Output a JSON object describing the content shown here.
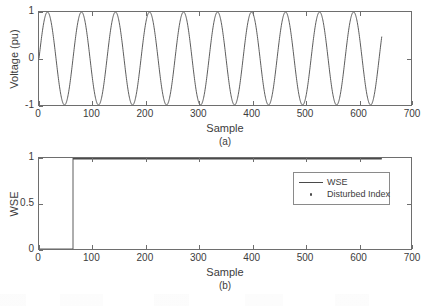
{
  "figure": {
    "background": "#ffffff",
    "line_color": "#4a4a4a",
    "axis_color": "#6e6e6e"
  },
  "chart_data": [
    {
      "type": "line",
      "panel": "a",
      "caption": "(a)",
      "title": "",
      "xlabel": "Sample",
      "ylabel": "Voltage (pu)",
      "xlim": [
        0,
        700
      ],
      "ylim": [
        -1,
        1
      ],
      "xticks": [
        0,
        100,
        200,
        300,
        400,
        500,
        600,
        700
      ],
      "xticklabels": [
        "0",
        "100",
        "200",
        "300",
        "400",
        "500",
        "600",
        "700"
      ],
      "yticks": [
        -1,
        0,
        1
      ],
      "yticklabels": [
        "-1",
        "0",
        "1"
      ],
      "grid": false,
      "legend": null,
      "series": [
        {
          "name": "voltage",
          "waveform": "sine",
          "amplitude": 1,
          "period_samples": 64,
          "phase_deg": 0,
          "x_start": 0,
          "x_end": 645,
          "color": "#4a4a4a",
          "linewidth": 1
        }
      ]
    },
    {
      "type": "line",
      "panel": "b",
      "caption": "(b)",
      "title": "",
      "xlabel": "Sample",
      "ylabel": "WSE",
      "xlim": [
        0,
        700
      ],
      "ylim": [
        0,
        1
      ],
      "xticks": [
        0,
        100,
        200,
        300,
        400,
        500,
        600,
        700
      ],
      "xticklabels": [
        "0",
        "100",
        "200",
        "300",
        "400",
        "500",
        "600",
        "700"
      ],
      "yticks": [
        0,
        0.5,
        1
      ],
      "yticklabels": [
        "0",
        "0.5",
        "1"
      ],
      "grid": false,
      "legend": {
        "position": "upper right",
        "entries": [
          {
            "label": "WSE",
            "marker": "line",
            "color": "#4a4a4a"
          },
          {
            "label": "Disturbed Index",
            "marker": "dot",
            "color": "#4a4a4a"
          }
        ]
      },
      "series": [
        {
          "name": "WSE",
          "waveform": "step",
          "low_value": 0,
          "high_value": 1,
          "step_at_sample": 64,
          "x_start": 0,
          "x_end": 645,
          "color": "#4a4a4a",
          "linewidth": 1
        },
        {
          "name": "Disturbed Index",
          "waveform": "markers",
          "marker": "dot",
          "y_value": 1,
          "x_start": 64,
          "x_end": 645,
          "color": "#4a4a4a"
        }
      ]
    }
  ]
}
